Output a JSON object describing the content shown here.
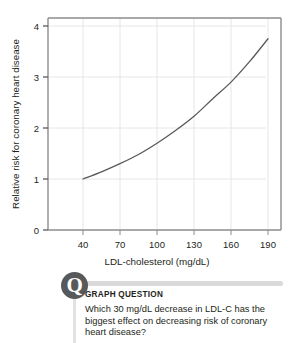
{
  "chart_data": {
    "type": "line",
    "title": "",
    "xlabel": "LDL-cholesterol (mg/dL)",
    "ylabel": "Relative risk for coronary heart disease",
    "xlim": [
      25,
      200
    ],
    "ylim": [
      0,
      4.2
    ],
    "xticks": [
      "40",
      "70",
      "100",
      "130",
      "160",
      "190"
    ],
    "xtick_values": [
      40,
      70,
      100,
      130,
      160,
      190
    ],
    "yticks": [
      "0",
      "1",
      "2",
      "3",
      "4"
    ],
    "ytick_values": [
      0,
      1,
      2,
      3,
      4
    ],
    "grid": true,
    "legend": "none",
    "series": [
      {
        "name": "Relative risk",
        "x": [
          40,
          55,
          70,
          85,
          100,
          115,
          130,
          145,
          160,
          175,
          190
        ],
        "values": [
          1.0,
          1.14,
          1.3,
          1.48,
          1.7,
          1.95,
          2.23,
          2.57,
          2.9,
          3.3,
          3.75
        ]
      }
    ],
    "line_color": "#595959",
    "grid_color": "#e6e6e6",
    "axis_color": "#8c8c8c"
  },
  "question": {
    "badge_letter": "Q",
    "heading": "GRAPH QUESTION",
    "text": "Which 30 mg/dL decrease in LDL-C has the biggest effect on decreasing risk of coronary heart disease?"
  }
}
